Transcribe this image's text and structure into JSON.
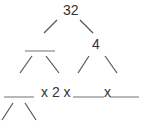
{
  "diagram": {
    "type": "factor-tree",
    "root": "32",
    "level1": {
      "left": "",
      "right": "4"
    },
    "bottom_row": {
      "blank_1": "",
      "operator_1": "x 2 x",
      "blank_2": "",
      "operator_2": "x",
      "blank_3": ""
    },
    "colors": {
      "line": "#555555",
      "blank": "#888888",
      "text": "#333333"
    }
  }
}
